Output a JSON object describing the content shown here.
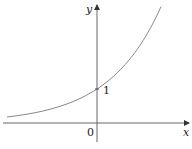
{
  "chart_data": {
    "type": "line",
    "title": "",
    "xlabel": "x",
    "ylabel": "y",
    "function": "y = e^x",
    "series": [
      {
        "name": "exponential curve",
        "x": [
          -1.75,
          -1.5,
          -1.0,
          -0.5,
          0,
          0.5,
          1.0,
          1.2
        ],
        "values": [
          0.17,
          0.22,
          0.37,
          0.61,
          1.0,
          1.65,
          2.72,
          3.32
        ]
      }
    ],
    "annotations": [
      {
        "text": "1",
        "x": 0,
        "y": 1,
        "note": "y-intercept"
      },
      {
        "text": "0",
        "x": 0,
        "y": 0,
        "note": "origin"
      }
    ],
    "xlim": [
      -1.75,
      1.75
    ],
    "ylim": [
      -0.55,
      3.4
    ],
    "grid": false,
    "legend": "none"
  },
  "labels": {
    "x_axis": "x",
    "y_axis": "y",
    "origin": "0",
    "intercept": "1"
  },
  "colors": {
    "axis": "#555555",
    "curve": "#777777",
    "text": "#222222"
  }
}
